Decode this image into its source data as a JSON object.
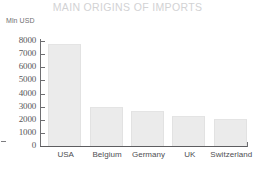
{
  "chart_data": {
    "type": "bar",
    "title": "MAIN ORIGINS OF IMPORTS",
    "unit_label": "Mln USD",
    "xlabel": "",
    "ylabel": "Mln USD",
    "ylim": [
      0,
      8000
    ],
    "grid": false,
    "legend": null,
    "y_ticks": [
      0,
      1000,
      2000,
      3000,
      4000,
      5000,
      6000,
      7000,
      8000
    ],
    "y_tick_labels": [
      "0",
      "1000",
      "2000",
      "3000",
      "4000",
      "5000",
      "6000",
      "7000",
      "8000"
    ],
    "categories": [
      "USA",
      "Belgium",
      "Germany",
      "UK",
      "Switzerland"
    ],
    "values": [
      7750,
      2980,
      2680,
      2320,
      2080
    ],
    "bar_color": "#ebebeb",
    "bar_edge_color": "#e2e2e2",
    "axis_color": "#6e6e71",
    "title_color": "#d2d2d4",
    "tick_label_color": "#58585b",
    "background_color": "#ffffff"
  }
}
